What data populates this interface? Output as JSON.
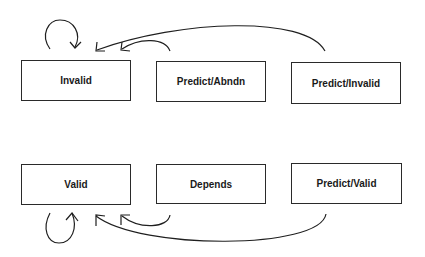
{
  "diagram": {
    "type": "state-transition",
    "states": [
      {
        "id": "invalid",
        "label": "Invalid"
      },
      {
        "id": "predict_abndn",
        "label": "Predict/Abndn"
      },
      {
        "id": "predict_invalid",
        "label": "Predict/Invalid"
      },
      {
        "id": "valid",
        "label": "Valid"
      },
      {
        "id": "depends",
        "label": "Depends"
      },
      {
        "id": "predict_valid",
        "label": "Predict/Valid"
      }
    ],
    "transitions": [
      {
        "from": "invalid",
        "to": "invalid"
      },
      {
        "from": "predict_abndn",
        "to": "invalid"
      },
      {
        "from": "predict_invalid",
        "to": "invalid"
      },
      {
        "from": "valid",
        "to": "valid"
      },
      {
        "from": "depends",
        "to": "valid"
      },
      {
        "from": "predict_valid",
        "to": "valid"
      }
    ]
  }
}
